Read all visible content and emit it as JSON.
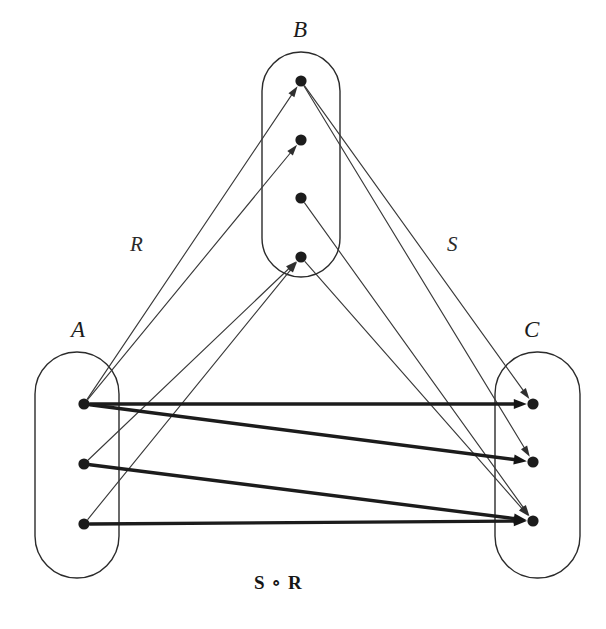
{
  "figure": {
    "width": 606,
    "height": 629,
    "background": "#ffffff",
    "stroke_color": "#2b2b2b",
    "node_color": "#1c1c1c",
    "thin_edge_color": "#3a3a3a",
    "thick_edge_color": "#1c1c1c",
    "caption": "S ∘ R"
  },
  "labels": {
    "set_a": "A",
    "set_b": "B",
    "set_c": "C",
    "relation_r": "R",
    "relation_s": "S",
    "composition": "S ∘ R"
  },
  "sets": [
    {
      "id": "A",
      "label": "A",
      "label_x": 71,
      "label_y": 318,
      "capsule": {
        "x": 35,
        "y": 352,
        "w": 84,
        "h": 226,
        "r": 42
      },
      "nodes": [
        {
          "id": "a1",
          "x": 84,
          "y": 404,
          "r": 5.6
        },
        {
          "id": "a2",
          "x": 84,
          "y": 464,
          "r": 5.6
        },
        {
          "id": "a3",
          "x": 84,
          "y": 524,
          "r": 5.6
        }
      ]
    },
    {
      "id": "B",
      "label": "B",
      "label_x": 293,
      "label_y": 18,
      "capsule": {
        "x": 262,
        "y": 52,
        "w": 78,
        "h": 225,
        "r": 39
      },
      "nodes": [
        {
          "id": "b1",
          "x": 301,
          "y": 81,
          "r": 5.6
        },
        {
          "id": "b2",
          "x": 301,
          "y": 140,
          "r": 5.6
        },
        {
          "id": "b3",
          "x": 301,
          "y": 198,
          "r": 5.6
        },
        {
          "id": "b4",
          "x": 301,
          "y": 257,
          "r": 5.6
        }
      ]
    },
    {
      "id": "C",
      "label": "C",
      "label_x": 524,
      "label_y": 318,
      "capsule": {
        "x": 495,
        "y": 352,
        "w": 85,
        "h": 226,
        "r": 42
      },
      "nodes": [
        {
          "id": "c1",
          "x": 533,
          "y": 404,
          "r": 5.6
        },
        {
          "id": "c2",
          "x": 533,
          "y": 462,
          "r": 5.6
        },
        {
          "id": "c3",
          "x": 533,
          "y": 521,
          "r": 5.6
        }
      ]
    }
  ],
  "relations": [
    {
      "name": "R",
      "style": "thin",
      "label_x": 130,
      "label_y": 234,
      "pairs": [
        {
          "from": "a1",
          "to": "b1"
        },
        {
          "from": "a1",
          "to": "b2"
        },
        {
          "from": "a2",
          "to": "b4"
        },
        {
          "from": "a3",
          "to": "b4"
        }
      ]
    },
    {
      "name": "S",
      "style": "thin",
      "label_x": 447,
      "label_y": 234,
      "pairs": [
        {
          "from": "b1",
          "to": "c1"
        },
        {
          "from": "b1",
          "to": "c2"
        },
        {
          "from": "b3",
          "to": "c3"
        },
        {
          "from": "b4",
          "to": "c3"
        }
      ]
    },
    {
      "name": "S ∘ R",
      "style": "thick",
      "label_x": 254,
      "label_y": 573,
      "pairs": [
        {
          "from": "a1",
          "to": "c1"
        },
        {
          "from": "a1",
          "to": "c2"
        },
        {
          "from": "a2",
          "to": "c3"
        },
        {
          "from": "a3",
          "to": "c3"
        }
      ]
    }
  ]
}
